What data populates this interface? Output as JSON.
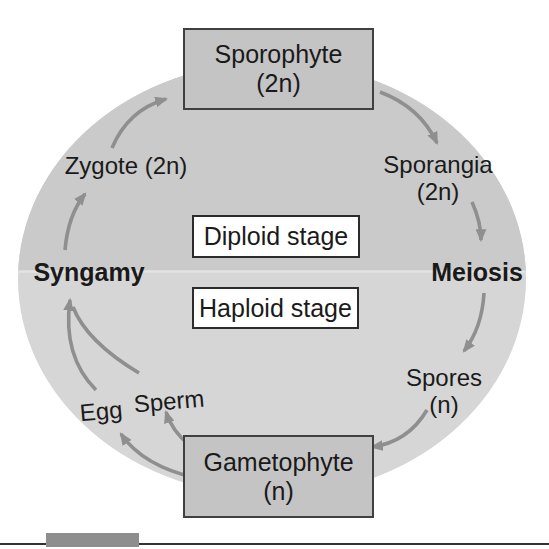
{
  "figure": {
    "cycle": {
      "sporophyte": {
        "line1": "Sporophyte",
        "line2": "(2n)"
      },
      "sporangia": {
        "line1": "Sporangia",
        "line2": "(2n)"
      },
      "meiosis": "Meiosis",
      "spores": {
        "line1": "Spores",
        "line2": "(n)"
      },
      "gametophyte": {
        "line1": "Gametophyte",
        "line2": "(n)"
      },
      "egg": "Egg",
      "sperm": "Sperm",
      "syngamy": "Syngamy",
      "zygote": "Zygote (2n)",
      "diploid_stage": "Diploid stage",
      "haploid_stage": "Haploid stage"
    },
    "arrows": [
      "zygote-to-sporophyte",
      "sporophyte-to-sporangia",
      "sporangia-to-meiosis",
      "meiosis-to-spores",
      "spores-to-gametophyte",
      "gametophyte-to-egg",
      "gametophyte-to-sperm",
      "egg-to-syngamy",
      "sperm-to-syngamy",
      "syngamy-to-zygote"
    ],
    "colors": {
      "circle_top_half": "#cacaca",
      "circle_bottom_half": "#d6d6d6",
      "circle_seam": "#e3e3e3",
      "node_box_fill": "#c4c4c4",
      "node_box_border": "#404040",
      "stage_box_fill": "#ffffff",
      "stage_box_border": "#2b2b2b",
      "arrow": "#8f8f8f",
      "text": "#1a1a1a",
      "caption_bar": "#8e8e8e",
      "bottom_rule": "#333333"
    }
  }
}
